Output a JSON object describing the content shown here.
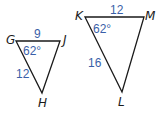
{
  "figure": {
    "triangles": [
      {
        "name": "GJH",
        "vertices": {
          "G": {
            "label": "G",
            "x": 16,
            "y": 41
          },
          "J": {
            "label": "J",
            "x": 60,
            "y": 41
          },
          "H": {
            "label": "H",
            "x": 42,
            "y": 93
          }
        },
        "measures": {
          "side_GJ": "9",
          "side_GH": "12",
          "angle_G": "62°"
        }
      },
      {
        "name": "KML",
        "vertices": {
          "K": {
            "label": "K",
            "x": 85,
            "y": 17
          },
          "M": {
            "label": "M",
            "x": 144,
            "y": 17
          },
          "L": {
            "label": "L",
            "x": 122,
            "y": 92
          }
        },
        "measures": {
          "side_KM": "12",
          "side_KL": "16",
          "angle_K": "62°"
        }
      }
    ],
    "colors": {
      "edge": "#1a1a1a",
      "measure_text": "#3a5fa8",
      "vertex_text": "#1a1a1a"
    }
  }
}
